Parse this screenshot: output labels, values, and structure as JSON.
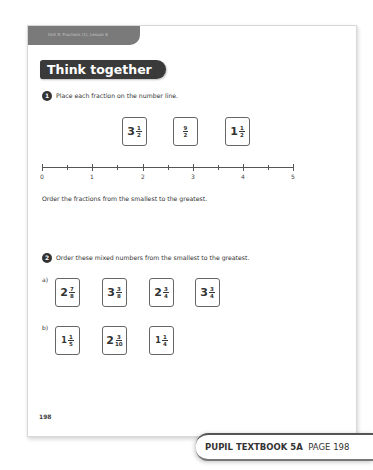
{
  "header": {
    "unit_label": "Unit 5: Fractions (1), Lesson 8",
    "section_title": "Think together"
  },
  "question1": {
    "number": "1",
    "prompt": "Place each fraction on the number line.",
    "cards": [
      {
        "whole": "3",
        "num": "1",
        "den": "2"
      },
      {
        "whole": "",
        "num": "9",
        "den": "2"
      },
      {
        "whole": "1",
        "num": "1",
        "den": "2"
      }
    ],
    "number_line": {
      "labels": [
        "0",
        "1",
        "2",
        "3",
        "4",
        "5"
      ]
    },
    "instruction": "Order the fractions from the smallest to the greatest."
  },
  "question2": {
    "number": "2",
    "prompt": "Order these mixed numbers from the smallest to the greatest.",
    "part_a": {
      "label": "a)",
      "cards": [
        {
          "whole": "2",
          "num": "7",
          "den": "8"
        },
        {
          "whole": "3",
          "num": "3",
          "den": "8"
        },
        {
          "whole": "2",
          "num": "3",
          "den": "4"
        },
        {
          "whole": "3",
          "num": "3",
          "den": "4"
        }
      ]
    },
    "part_b": {
      "label": "b)",
      "cards": [
        {
          "whole": "1",
          "num": "1",
          "den": "5"
        },
        {
          "whole": "2",
          "num": "3",
          "den": "10"
        },
        {
          "whole": "1",
          "num": "1",
          "den": "4"
        }
      ]
    }
  },
  "page_number": "198",
  "footer": {
    "book": "PUPIL TEXTBOOK 5A",
    "page": "PAGE 198"
  }
}
